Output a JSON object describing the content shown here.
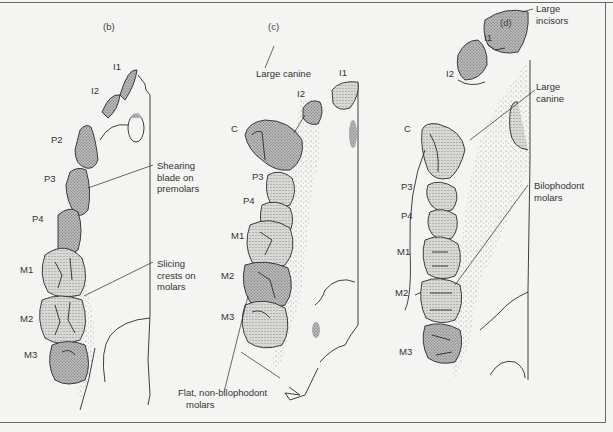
{
  "figure": {
    "panels": [
      {
        "id": "b",
        "label": "(b)",
        "teeth": [
          "I1",
          "I2",
          "P2",
          "P3",
          "P4",
          "M1",
          "M2",
          "M3"
        ],
        "annotations": [
          {
            "text": "Shearing blade on premolars",
            "lines": [
              "Shearing",
              "blade on",
              "premolars"
            ]
          },
          {
            "text": "Slicing crests on molars",
            "lines": [
              "Slicing",
              "crests on",
              "molars"
            ]
          }
        ]
      },
      {
        "id": "c",
        "label": "(c)",
        "teeth": [
          "I1",
          "I2",
          "C",
          "P3",
          "P4",
          "M1",
          "M2",
          "M3"
        ],
        "annotations": [
          {
            "text": "Large canine",
            "lines": [
              "Large canine"
            ]
          },
          {
            "text": "Flat, non-bilophodont molars",
            "lines": [
              "Flat, non-bilophodont",
              "molars"
            ]
          }
        ]
      },
      {
        "id": "d",
        "label": "(d)",
        "teeth": [
          "I1",
          "I2",
          "C",
          "P3",
          "P4",
          "M1",
          "M2",
          "M3"
        ],
        "annotations": [
          {
            "text": "Large incisors",
            "lines": [
              "Large",
              "incisors"
            ]
          },
          {
            "text": "Large canine",
            "lines": [
              "Large",
              "canine"
            ]
          },
          {
            "text": "Bilophodont molars",
            "lines": [
              "Bilophodont",
              "molars"
            ]
          }
        ]
      }
    ],
    "colors": {
      "background": "#f4f4f2",
      "ink": "#2a2a2a",
      "stipple": "#8a8a8a",
      "border": "#6a6a6a"
    }
  }
}
